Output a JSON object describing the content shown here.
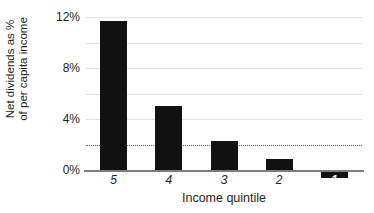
{
  "chart_data": {
    "type": "bar",
    "title": "",
    "xlabel": "Income quintile",
    "ylabel_line1": "Net dividends as %",
    "ylabel_line2": "of per capita income",
    "categories": [
      "5",
      "4",
      "3",
      "2",
      "1"
    ],
    "values": [
      11.7,
      5.0,
      2.3,
      0.9,
      -0.6
    ],
    "ylim": [
      -1,
      12
    ],
    "ytick_labels": [
      "12%",
      "8%",
      "4%",
      "0%"
    ],
    "ytick_values": [
      12,
      8,
      4,
      0
    ],
    "gridline_values": [
      12,
      10,
      8,
      6,
      4,
      2
    ],
    "grid": true,
    "legend": "none",
    "reference_line": {
      "value": 2,
      "style": "dotted"
    },
    "bar_color": "#111111",
    "grid_color": "#e3e3e3",
    "axis_color": "#7d7d7d"
  }
}
